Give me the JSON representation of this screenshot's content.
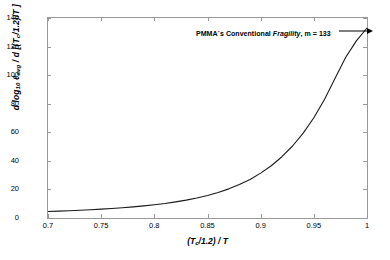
{
  "chart_data": {
    "type": "line",
    "title": "",
    "xlabel": "(T_c/1.2) / T",
    "ylabel": "d log10 l_avg / d [(T_c/1.2)/T ]",
    "xlim": [
      0.7,
      1.0
    ],
    "ylim": [
      0,
      140
    ],
    "xticks": [
      "0.7",
      "0.75",
      "0.8",
      "0.85",
      "0.9",
      "0.95",
      "1"
    ],
    "xtick_values": [
      0.7,
      0.75,
      0.8,
      0.85,
      0.9,
      0.95,
      1.0
    ],
    "yticks": [
      "0",
      "20",
      "40",
      "60",
      "80",
      "100",
      "120",
      "140"
    ],
    "ytick_values": [
      0,
      20,
      40,
      60,
      80,
      100,
      120,
      140
    ],
    "grid": false,
    "legend": "none",
    "series": [
      {
        "name": "PMMA fragility derivative",
        "color": "#1a1a1a",
        "x": [
          0.7,
          0.71,
          0.72,
          0.73,
          0.74,
          0.75,
          0.76,
          0.77,
          0.78,
          0.79,
          0.8,
          0.81,
          0.82,
          0.83,
          0.84,
          0.85,
          0.86,
          0.87,
          0.88,
          0.89,
          0.9,
          0.91,
          0.92,
          0.93,
          0.94,
          0.95,
          0.96,
          0.97,
          0.98,
          0.99,
          1.0
        ],
        "y": [
          4.5,
          4.8,
          5.1,
          5.4,
          5.8,
          6.2,
          6.7,
          7.2,
          7.8,
          8.5,
          9.3,
          10.2,
          11.3,
          12.5,
          14.0,
          15.8,
          17.9,
          20.4,
          23.4,
          27.0,
          31.4,
          36.6,
          42.9,
          50.4,
          59.4,
          70.2,
          83.0,
          97.8,
          112.5,
          124.0,
          133.0
        ]
      }
    ],
    "annotations": [
      {
        "text_prefix": "PMMA´s Conventional ",
        "text_italic": "Fragility",
        "text_suffix": ", m = 133",
        "arrow": "right-arrow",
        "points_to_x": 1.0,
        "points_to_y": 133
      }
    ]
  },
  "axes": {
    "x_title": "(T",
    "x_title_sub": "c",
    "x_title_rest": "/1.2) / T",
    "y_title_a": "d log",
    "y_title_a_sub": "10",
    "y_title_b": " ℓ",
    "y_title_b_sub": "avg",
    "y_title_c": " / d [(T",
    "y_title_c_sub": "c",
    "y_title_d": "/1.2)/T ]"
  },
  "colors": {
    "background": "#ffffff",
    "frame": "#9a9a9a",
    "curve": "#1a1a1a",
    "text": "#000000"
  }
}
